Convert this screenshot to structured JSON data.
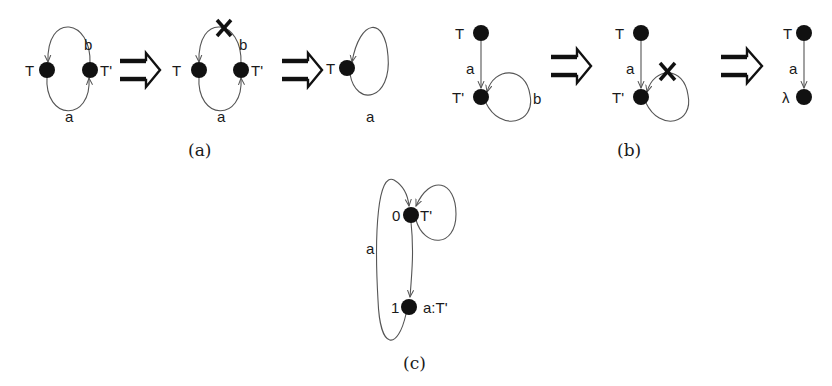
{
  "figure": {
    "panels": [
      {
        "id": "a",
        "caption": "(a)",
        "steps": [
          {
            "nodes": [
              {
                "label": "T"
              },
              {
                "label": "T'"
              }
            ],
            "edges": [
              {
                "label": "b",
                "from": "T'",
                "to": "T"
              },
              {
                "label": "a",
                "from": "T",
                "to": "T'"
              }
            ]
          },
          {
            "nodes": [
              {
                "label": "T"
              },
              {
                "label": "T'"
              }
            ],
            "edges": [
              {
                "label": "b",
                "from": "T'",
                "to": "T",
                "removed": true
              },
              {
                "label": "a",
                "from": "T",
                "to": "T'"
              }
            ],
            "removed_mark": "X"
          },
          {
            "nodes": [
              {
                "label": "T"
              }
            ],
            "edges": [
              {
                "label": "a",
                "from": "T",
                "to": "T",
                "self_loop": true
              }
            ]
          }
        ]
      },
      {
        "id": "b",
        "caption": "(b)",
        "steps": [
          {
            "nodes": [
              {
                "label": "T"
              },
              {
                "label": "T'"
              }
            ],
            "edges": [
              {
                "label": "a",
                "from": "T",
                "to": "T'"
              },
              {
                "label": "b",
                "from": "T'",
                "to": "T'",
                "self_loop": true
              }
            ]
          },
          {
            "nodes": [
              {
                "label": "T"
              },
              {
                "label": "T'"
              }
            ],
            "edges": [
              {
                "label": "a",
                "from": "T",
                "to": "T'"
              },
              {
                "label": "",
                "from": "T'",
                "to": "T'",
                "self_loop": true,
                "removed": true
              }
            ],
            "removed_mark": "X"
          },
          {
            "nodes": [
              {
                "label": "T"
              },
              {
                "label": "λ"
              }
            ],
            "edges": [
              {
                "label": "a",
                "from": "T",
                "to": "λ"
              }
            ]
          }
        ]
      },
      {
        "id": "c",
        "caption": "(c)",
        "nodes": [
          {
            "id": "0",
            "label": "0",
            "annotation": "T'"
          },
          {
            "id": "1",
            "label": "1",
            "annotation": "a:T'"
          }
        ],
        "edges": [
          {
            "label": "",
            "from": "0",
            "to": "1"
          },
          {
            "label": "a",
            "from": "1",
            "to": "0"
          },
          {
            "label": "",
            "from": "0",
            "to": "0",
            "self_loop": true
          }
        ]
      }
    ],
    "transition_symbol": "⟹"
  },
  "labels": {
    "a1_T": "T",
    "a1_Tp": "T'",
    "a1_b": "b",
    "a1_a": "a",
    "a2_T": "T",
    "a2_Tp": "T'",
    "a2_b": "b",
    "a2_a": "a",
    "a2_x": "X",
    "a3_T": "T",
    "a3_a": "a",
    "a_caption": "(a)",
    "b1_T": "T",
    "b1_Tp": "T'",
    "b1_a": "a",
    "b1_b": "b",
    "b2_T": "T",
    "b2_Tp": "T'",
    "b2_a": "a",
    "b2_x": "X",
    "b3_T": "T",
    "b3_lambda": "λ",
    "b3_a": "a",
    "b_caption": "(b)",
    "c_0": "0",
    "c_0_ann": "T'",
    "c_1": "1",
    "c_1_ann": "a:T'",
    "c_a": "a",
    "c_caption": "(c)"
  }
}
